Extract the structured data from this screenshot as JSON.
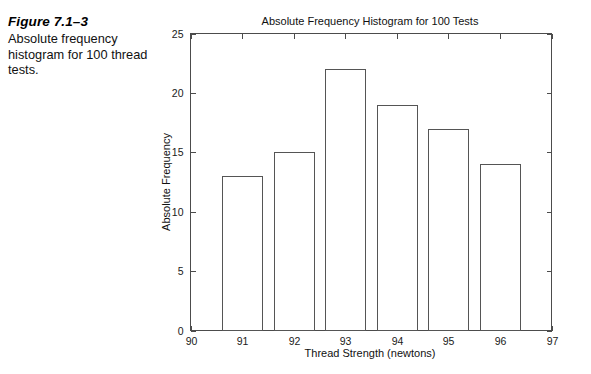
{
  "caption": {
    "figure_number": "Figure 7.1–3",
    "text": "Absolute frequency histogram for 100 thread tests."
  },
  "chart_data": {
    "type": "bar",
    "title": "Absolute Frequency Histogram for 100 Tests",
    "xlabel": "Thread Strength (newtons)",
    "ylabel": "Absolute Frequency",
    "categories": [
      "91",
      "92",
      "93",
      "94",
      "95",
      "96"
    ],
    "values": [
      13,
      15,
      22,
      19,
      17,
      14
    ],
    "bin_edges": [
      90.5,
      91.5,
      92.5,
      93.5,
      94.5,
      95.5,
      96.5
    ],
    "bar_width": 0.78,
    "xlim": [
      90,
      97
    ],
    "ylim": [
      0,
      25
    ],
    "xticks": [
      "90",
      "91",
      "92",
      "93",
      "94",
      "95",
      "96",
      "97"
    ],
    "yticks": [
      "0",
      "5",
      "10",
      "15",
      "20",
      "25"
    ],
    "grid": false,
    "legend": "none",
    "bar_fill": "#ffffff",
    "bar_stroke": "#555555",
    "axis_color": "#4c4c4c"
  }
}
